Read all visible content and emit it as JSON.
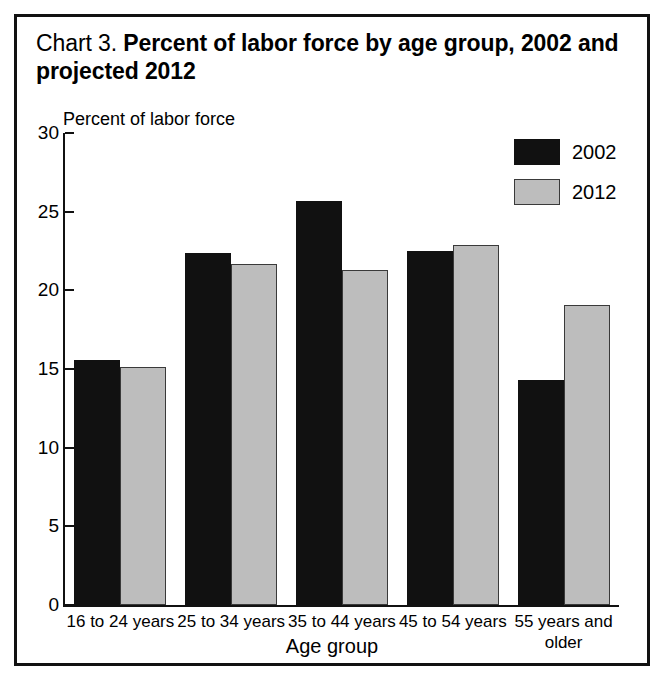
{
  "title": {
    "lead": "Chart 3.",
    "main": "Percent of labor force by age group, 2002 and projected 2012"
  },
  "axes": {
    "ylabel": "Percent of labor force",
    "xlabel": "Age group",
    "yticks": [
      "0",
      "5",
      "10",
      "15",
      "20",
      "25",
      "30"
    ]
  },
  "legend": {
    "items": [
      {
        "label": "2002",
        "color": "#111111"
      },
      {
        "label": "2012",
        "color": "#bdbdbd"
      }
    ]
  },
  "categories": [
    "16 to 24 years",
    "25 to 34 years",
    "35 to 44 years",
    "45 to 54 years",
    "55 years and older"
  ],
  "chart_data": {
    "type": "bar",
    "title": "Chart 3.  Percent of labor force by age group, 2002 and projected 2012",
    "xlabel": "Age group",
    "ylabel": "Percent of labor force",
    "ylim": [
      0,
      30
    ],
    "ytick_step": 5,
    "grid": false,
    "legend_position": "top-right",
    "categories": [
      "16 to 24 years",
      "25 to 34 years",
      "35 to 44 years",
      "45 to 54 years",
      "55 years and older"
    ],
    "series": [
      {
        "name": "2002",
        "color": "#111111",
        "values": [
          15.6,
          22.4,
          25.7,
          22.5,
          14.3
        ]
      },
      {
        "name": "2012",
        "color": "#bdbdbd",
        "values": [
          15.1,
          21.7,
          21.3,
          22.9,
          19.1
        ]
      }
    ]
  }
}
